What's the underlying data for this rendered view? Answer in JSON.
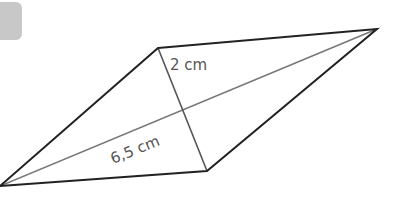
{
  "figure": {
    "shape": "rhombus-kite",
    "vertices": {
      "top": [
        158,
        48
      ],
      "right": [
        377,
        29
      ],
      "bottom": [
        207,
        171
      ],
      "left": [
        0,
        186
      ]
    },
    "outline_color": "#222222",
    "diagonal_color": "#777777",
    "labels": {
      "short_diagonal_half": "2 cm",
      "long_diagonal_half": "6,5 cm"
    }
  },
  "badge": {
    "color": "#c8c8c8"
  }
}
